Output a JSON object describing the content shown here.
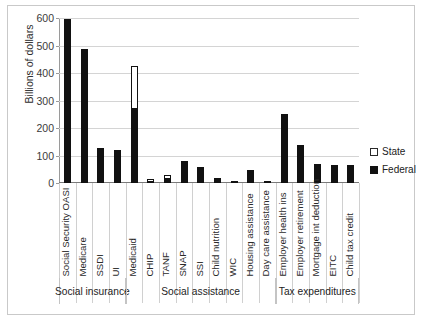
{
  "chart_data": {
    "type": "bar",
    "stacked": true,
    "title": "",
    "xlabel": "",
    "ylabel": "Billions of dollars",
    "ylim": [
      0,
      600
    ],
    "yticks": [
      0,
      100,
      200,
      300,
      400,
      500,
      600
    ],
    "grid": true,
    "legend_position": "right",
    "legend": [
      "State",
      "Federal"
    ],
    "colors": {
      "state": "#ffffff",
      "federal": "#111111",
      "gridline": "#d4d4d4"
    },
    "categories": [
      "Social Security OASI",
      "Medicare",
      "SSDI",
      "UI",
      "Medicaid",
      "CHIP",
      "TANF",
      "SNAP",
      "SSI",
      "Child nutrition",
      "WIC",
      "Housing assistance",
      "Day care assistance",
      "Employer health ins",
      "Employer retirement",
      "Mortgage int deduction",
      "EITC",
      "Child tax credit"
    ],
    "series": [
      {
        "name": "Federal",
        "values": [
          595,
          487,
          128,
          119,
          273,
          9,
          17,
          80,
          53,
          20,
          7,
          47,
          8,
          252,
          137,
          69,
          67,
          64
        ]
      },
      {
        "name": "State",
        "values": [
          0,
          0,
          0,
          0,
          154,
          4,
          13,
          0,
          5,
          0,
          0,
          0,
          0,
          0,
          0,
          0,
          0,
          0
        ]
      }
    ],
    "groups": [
      {
        "label": "Social insurance",
        "start": 0,
        "count": 4
      },
      {
        "label": "Social assistance",
        "start": 4,
        "count": 9
      },
      {
        "label": "Tax expenditures",
        "start": 13,
        "count": 5
      }
    ]
  }
}
